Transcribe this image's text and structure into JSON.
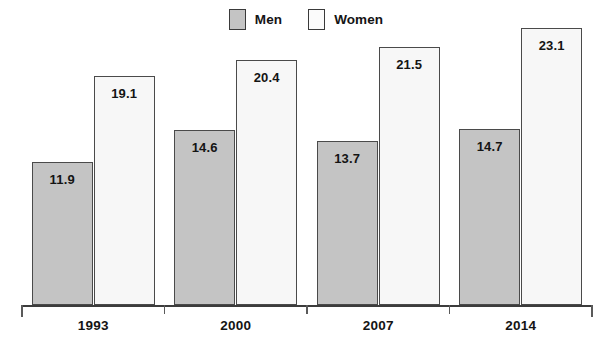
{
  "chart_data": {
    "type": "bar",
    "title": "",
    "subtitle": "",
    "xlabel": "",
    "ylabel": "",
    "categories": [
      "1993",
      "2000",
      "2007",
      "2014"
    ],
    "series": [
      {
        "name": "Men",
        "values": [
          11.9,
          14.6,
          13.7,
          14.7
        ],
        "color": "#c4c4c4"
      },
      {
        "name": "Women",
        "values": [
          19.1,
          20.4,
          21.5,
          23.1
        ],
        "color": "#f7f7f7"
      }
    ],
    "value_labels": {
      "men": [
        "11.9",
        "14.6",
        "13.7",
        "14.7"
      ],
      "women": [
        "19.1",
        "20.4",
        "21.5",
        "23.1"
      ]
    },
    "ylim": [
      0,
      25.4
    ],
    "grid": false,
    "legend_position": "top-center",
    "legend": [
      {
        "label": "Men",
        "swatch": "#c4c4c4"
      },
      {
        "label": "Women",
        "swatch": "#f7f7f7"
      }
    ],
    "axis": {
      "baseline_visible": true,
      "y_axis_visible": false,
      "tick_labels": [
        "1993",
        "2000",
        "2007",
        "2014"
      ]
    },
    "colors": {
      "men_fill": "#c4c4c4",
      "women_fill": "#f7f7f7",
      "bar_border": "#4a4a4a",
      "axis": "#3c3c3c",
      "text": "#141414",
      "background": "#ffffff"
    }
  }
}
